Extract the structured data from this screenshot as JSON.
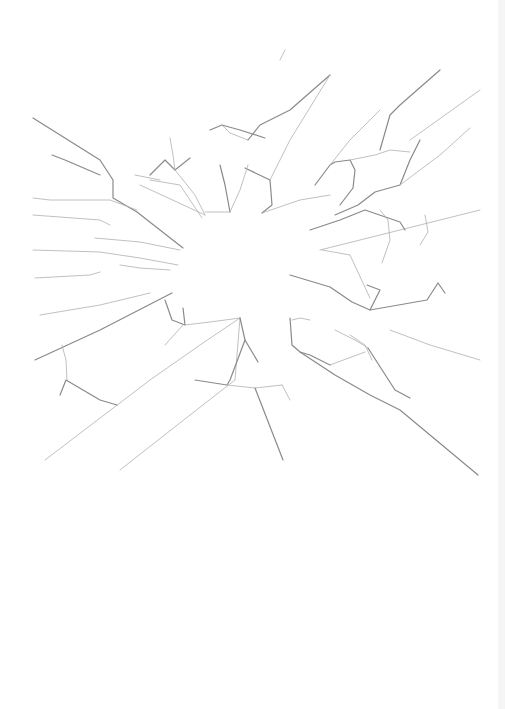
{
  "image": {
    "subject": "shattered glass crack pattern",
    "background_color": "#ffffff",
    "crack_color": "#8a8a8a",
    "crack_dark_color": "#6a6a6a"
  }
}
